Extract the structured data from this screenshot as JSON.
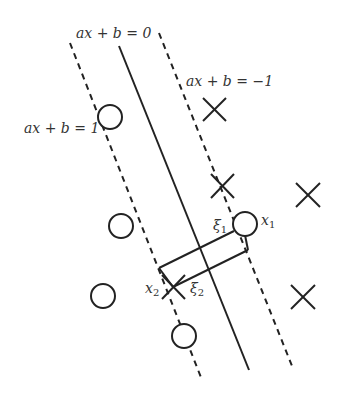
{
  "diagram": {
    "type": "svm-soft-margin",
    "lines": [
      {
        "id": "decision-boundary",
        "label": "ax + b = 0",
        "style": "solid"
      },
      {
        "id": "margin-positive",
        "label": "ax + b = 1",
        "style": "dashed"
      },
      {
        "id": "margin-negative",
        "label": "ax + b = −1",
        "style": "dashed"
      }
    ],
    "labels": {
      "boundary": "ax + b = 0",
      "margin_pos": "ax + b = 1",
      "margin_neg": "ax + b = −1",
      "x1": "x",
      "x1_sub": "1",
      "x2": "x",
      "x2_sub": "2",
      "xi1": "ξ",
      "xi1_sub": "1",
      "xi2": "ξ",
      "xi2_sub": "2"
    },
    "points": {
      "circles": [
        {
          "x": 110,
          "y": 117
        },
        {
          "x": 121,
          "y": 226
        },
        {
          "x": 103,
          "y": 296
        },
        {
          "x": 184,
          "y": 336
        },
        {
          "x": 245,
          "y": 224,
          "label": "x1"
        }
      ],
      "crosses": [
        {
          "x": 214,
          "y": 109
        },
        {
          "x": 222,
          "y": 186
        },
        {
          "x": 308,
          "y": 195
        },
        {
          "x": 303,
          "y": 297
        },
        {
          "x": 173,
          "y": 287,
          "label": "x2"
        }
      ]
    },
    "colors": {
      "stroke": "#222222",
      "text": "#333333",
      "background": "#ffffff"
    }
  }
}
